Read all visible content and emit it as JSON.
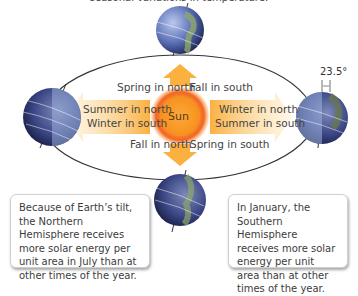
{
  "caption_top": "seasonal variations in temperature.",
  "sun": {
    "label": "Sun",
    "color": "#f7931e"
  },
  "tilt_angle": "23.5°",
  "season_labels": {
    "top_left": "Spring in north",
    "top_right": "Fall in south",
    "left_line1": "Summer in north",
    "left_line2": "Winter in south",
    "right_line1": "Winter in north",
    "right_line2": "Summer in south",
    "bottom_left": "Fall in north",
    "bottom_right": "Spring in south"
  },
  "notes": {
    "left": "Because of Earth’s tilt, the Northern Hemisphere receives more solar energy per unit area in July than at other times of the year.",
    "right": "In January, the Southern Hemisphere receives more solar energy per unit area than at other times of the year."
  },
  "colors": {
    "arrow": "#fbb040",
    "arrow_light": "#fde3b0",
    "orbit": "#333333",
    "ocean": "#5b6fb5",
    "land": "#8fa86a"
  }
}
